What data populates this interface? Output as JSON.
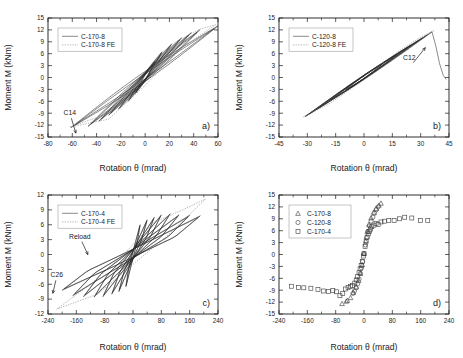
{
  "figure": {
    "panels": [
      "a)",
      "b)",
      "c)",
      "d)"
    ],
    "axis_titles": {
      "x": "Rotation θ (mrad)",
      "y": "Moment M (kNm)"
    }
  },
  "chart_data": [
    {
      "panel": "a)",
      "type": "line",
      "title": "",
      "xlabel": "Rotation θ (mrad)",
      "ylabel": "Moment M (kNm)",
      "xlim": [
        -80,
        60
      ],
      "ylim": [
        -15,
        15
      ],
      "xticks": [
        -80,
        -60,
        -40,
        -20,
        0,
        20,
        40,
        60
      ],
      "yticks": [
        -15,
        -12,
        -9,
        -6,
        -3,
        0,
        3,
        6,
        9,
        12,
        15
      ],
      "grid": false,
      "legend_position": "upper-left",
      "legend": [
        "C-170-8",
        "C-170-8 FE"
      ],
      "annotations": [
        {
          "text": "C14",
          "x": -62,
          "y": -9.5
        }
      ],
      "series": [
        {
          "name": "C-170-8",
          "style": "solid",
          "description": "Experimental cyclic moment-rotation hysteresis loops, spindle shaped, reaching about +12 kNm near +45 mrad and about -12.5 kNm near -60 mrad",
          "loops": [
            {
              "peak_pos": [
                8,
                4.0
              ],
              "peak_neg": [
                -8,
                -4.0
              ]
            },
            {
              "peak_pos": [
                14,
                6.5
              ],
              "peak_neg": [
                -14,
                -6.0
              ]
            },
            {
              "peak_pos": [
                22,
                8.5
              ],
              "peak_neg": [
                -22,
                -8.0
              ]
            },
            {
              "peak_pos": [
                30,
                10.0
              ],
              "peak_neg": [
                -30,
                -9.5
              ]
            },
            {
              "peak_pos": [
                38,
                11.3
              ],
              "peak_neg": [
                -38,
                -11.0
              ]
            },
            {
              "peak_pos": [
                45,
                12.0
              ],
              "peak_neg": [
                -47,
                -12.3
              ]
            },
            {
              "peak_pos": [
                60,
                13.0
              ],
              "peak_neg": [
                -61,
                -12.6
              ]
            }
          ]
        },
        {
          "name": "C-170-8 FE",
          "style": "dotted",
          "description": "Finite element envelope loop, wider than experimental, from (-62,-12.5) to (+58,13.3)",
          "envelope_pos": [
            [
              -62,
              -12.5
            ],
            [
              -30,
              -9.0
            ],
            [
              0,
              0.5
            ],
            [
              25,
              9.0
            ],
            [
              45,
              12.2
            ],
            [
              58,
              13.3
            ]
          ],
          "envelope_neg": [
            [
              58,
              13.3
            ],
            [
              30,
              7.5
            ],
            [
              0,
              -2.0
            ],
            [
              -30,
              -10.5
            ],
            [
              -62,
              -12.5
            ]
          ]
        }
      ]
    },
    {
      "panel": "b)",
      "type": "line",
      "title": "",
      "xlabel": "Rotation θ (mrad)",
      "ylabel": "Moment M (kNm)",
      "xlim": [
        -45,
        45
      ],
      "ylim": [
        -15,
        15
      ],
      "xticks": [
        -45,
        -30,
        -15,
        0,
        15,
        30,
        45
      ],
      "yticks": [
        -15,
        -12,
        -9,
        -6,
        -3,
        0,
        3,
        6,
        9,
        12,
        15
      ],
      "grid": false,
      "legend_position": "upper-left",
      "legend": [
        "C-120-8",
        "C-120-8 FE"
      ],
      "annotations": [
        {
          "text": "C12",
          "x": 24,
          "y": 4.5
        }
      ],
      "series": [
        {
          "name": "C-120-8",
          "style": "solid",
          "description": "Narrow elongated hysteresis loops along a steep line; peak about +11.5 kNm at +36 mrad then sharp drop (fracture) to about 0 kNm at +43 mrad; negative end about -9.8 kNm at -31 mrad",
          "loops": [
            {
              "peak_pos": [
                10,
                3.5
              ],
              "peak_neg": [
                -10,
                -3.2
              ]
            },
            {
              "peak_pos": [
                18,
                6.0
              ],
              "peak_neg": [
                -18,
                -5.8
              ]
            },
            {
              "peak_pos": [
                25,
                8.2
              ],
              "peak_neg": [
                -25,
                -8.0
              ]
            },
            {
              "peak_pos": [
                31,
                10.0
              ],
              "peak_neg": [
                -31,
                -9.8
              ]
            },
            {
              "peak_pos": [
                36,
                11.5
              ],
              "peak_neg": [
                -31,
                -9.8
              ]
            }
          ],
          "fracture": [
            [
              36,
              11.5
            ],
            [
              38,
              8.0
            ],
            [
              40,
              3.5
            ],
            [
              42,
              0.5
            ],
            [
              43.5,
              -0.5
            ]
          ]
        },
        {
          "name": "C-120-8 FE",
          "style": "dotted",
          "description": "Finite element loop slightly wider, peak near (37,11.8), negative end near (-32,-9.9)",
          "envelope_pos": [
            [
              -32,
              -9.9
            ],
            [
              -15,
              -5.0
            ],
            [
              0,
              0.3
            ],
            [
              18,
              6.5
            ],
            [
              30,
              10.2
            ],
            [
              37,
              11.8
            ]
          ],
          "envelope_neg": [
            [
              37,
              11.8
            ],
            [
              20,
              6.0
            ],
            [
              0,
              -0.6
            ],
            [
              -18,
              -6.5
            ],
            [
              -32,
              -9.9
            ]
          ]
        }
      ]
    },
    {
      "panel": "c)",
      "type": "line",
      "title": "",
      "xlabel": "Rotation θ (mrad)",
      "ylabel": "Moment M (kNm)",
      "xlim": [
        -240,
        240
      ],
      "ylim": [
        -12,
        12
      ],
      "xticks": [
        -240,
        -160,
        -80,
        0,
        80,
        160,
        240
      ],
      "yticks": [
        -12,
        -9,
        -6,
        -3,
        0,
        3,
        6,
        9,
        12
      ],
      "grid": false,
      "legend_position": "upper-left",
      "legend": [
        "C-170-4",
        "C-170-4 FE"
      ],
      "annotations": [
        {
          "text": "Reload",
          "x": -150,
          "y": 3.2
        },
        {
          "text": "C26",
          "x": -215,
          "y": -4.6
        }
      ],
      "series": [
        {
          "name": "C-170-4",
          "style": "solid",
          "description": "Many broad pinched hysteresis loops, flag shaped, positive plateau about +8 kNm, negative plateau about -8.5 kNm, rotations up to +190 and -200 mrad",
          "loops": [
            {
              "peak_pos": [
                20,
                6.0
              ],
              "peak_neg": [
                -20,
                -6.5
              ]
            },
            {
              "peak_pos": [
                40,
                7.0
              ],
              "peak_neg": [
                -40,
                -7.5
              ]
            },
            {
              "peak_pos": [
                60,
                7.5
              ],
              "peak_neg": [
                -60,
                -8.0
              ]
            },
            {
              "peak_pos": [
                80,
                8.0
              ],
              "peak_neg": [
                -85,
                -8.5
              ]
            },
            {
              "peak_pos": [
                105,
                8.2
              ],
              "peak_neg": [
                -110,
                -8.6
              ]
            },
            {
              "peak_pos": [
                130,
                8.0
              ],
              "peak_neg": [
                -140,
                -8.5
              ]
            },
            {
              "peak_pos": [
                160,
                7.9
              ],
              "peak_neg": [
                -170,
                -8.3
              ]
            },
            {
              "peak_pos": [
                190,
                7.8
              ],
              "peak_neg": [
                -200,
                -7.2
              ]
            }
          ]
        },
        {
          "name": "C-170-4 FE",
          "style": "dotted",
          "description": "Finite element envelope reaching about +11 kNm near +200 mrad and -11 kNm near -215 mrad",
          "envelope_pos": [
            [
              -215,
              -11.0
            ],
            [
              -120,
              -6.0
            ],
            [
              -20,
              0.5
            ],
            [
              60,
              6.5
            ],
            [
              140,
              9.0
            ],
            [
              205,
              11.2
            ]
          ],
          "envelope_neg": [
            [
              205,
              11.2
            ],
            [
              100,
              4.0
            ],
            [
              0,
              -2.0
            ],
            [
              -100,
              -8.0
            ],
            [
              -215,
              -11.0
            ]
          ]
        }
      ]
    },
    {
      "panel": "d)",
      "type": "scatter",
      "title": "",
      "xlabel": "Rotation θ (mrad)",
      "ylabel": "Moment M (kNm)",
      "xlim": [
        -240,
        240
      ],
      "ylim": [
        -15,
        15
      ],
      "xticks": [
        -240,
        -160,
        -80,
        0,
        80,
        160,
        240
      ],
      "yticks": [
        -15,
        -12,
        -9,
        -6,
        -3,
        0,
        3,
        6,
        9,
        12,
        15
      ],
      "grid": false,
      "legend_position": "upper-left",
      "legend": [
        "C-170-8",
        "C-120-8",
        "C-170-4"
      ],
      "series": [
        {
          "name": "C-170-8",
          "marker": "triangle",
          "points": [
            [
              -62,
              -12.4
            ],
            [
              -50,
              -11.8
            ],
            [
              -47,
              -11.6
            ],
            [
              -38,
              -10.9
            ],
            [
              -30,
              -9.6
            ],
            [
              -22,
              -8.2
            ],
            [
              -15,
              -6.6
            ],
            [
              -10,
              -4.8
            ],
            [
              -5,
              -2.6
            ],
            [
              0,
              0.2
            ],
            [
              5,
              3.4
            ],
            [
              9,
              5.8
            ],
            [
              14,
              7.6
            ],
            [
              20,
              9.2
            ],
            [
              27,
              10.6
            ],
            [
              34,
              11.6
            ],
            [
              42,
              12.4
            ],
            [
              48,
              12.9
            ]
          ]
        },
        {
          "name": "C-120-8",
          "marker": "circle",
          "points": [
            [
              -31,
              -9.8
            ],
            [
              -27,
              -9.2
            ],
            [
              -22,
              -8.4
            ],
            [
              -18,
              -7.4
            ],
            [
              -14,
              -6.2
            ],
            [
              -10,
              -4.8
            ],
            [
              -7,
              -3.4
            ],
            [
              -4,
              -1.8
            ],
            [
              0,
              0.2
            ],
            [
              4,
              2.4
            ],
            [
              7,
              4.2
            ],
            [
              11,
              5.8
            ],
            [
              15,
              7.2
            ],
            [
              20,
              8.4
            ],
            [
              25,
              9.4
            ],
            [
              30,
              10.4
            ],
            [
              35,
              11.3
            ],
            [
              40,
              12.0
            ]
          ]
        },
        {
          "name": "C-170-4",
          "marker": "square",
          "points": [
            [
              -205,
              -8.0
            ],
            [
              -185,
              -8.3
            ],
            [
              -170,
              -8.4
            ],
            [
              -150,
              -8.5
            ],
            [
              -130,
              -8.8
            ],
            [
              -115,
              -9.2
            ],
            [
              -100,
              -9.3
            ],
            [
              -88,
              -9.1
            ],
            [
              -78,
              -9.4
            ],
            [
              -68,
              -10.4
            ],
            [
              -60,
              -9.8
            ],
            [
              -52,
              -8.7
            ],
            [
              -45,
              -8.3
            ],
            [
              -38,
              -8.1
            ],
            [
              -32,
              -7.8
            ],
            [
              -26,
              -7.2
            ],
            [
              -22,
              -6.4
            ],
            [
              -18,
              -5.6
            ],
            [
              -14,
              -4.6
            ],
            [
              -11,
              -3.6
            ],
            [
              -8,
              -2.8
            ],
            [
              -5,
              -1.8
            ],
            [
              -2,
              -0.4
            ],
            [
              0,
              0.2
            ],
            [
              3,
              2.0
            ],
            [
              6,
              3.4
            ],
            [
              9,
              4.4
            ],
            [
              12,
              5.2
            ],
            [
              15,
              5.8
            ],
            [
              18,
              6.4
            ],
            [
              22,
              7.0
            ],
            [
              28,
              7.4
            ],
            [
              34,
              7.8
            ],
            [
              40,
              7.6
            ],
            [
              48,
              8.2
            ],
            [
              58,
              8.4
            ],
            [
              70,
              8.6
            ],
            [
              85,
              8.6
            ],
            [
              100,
              9.0
            ],
            [
              115,
              9.4
            ],
            [
              135,
              9.2
            ],
            [
              160,
              8.6
            ],
            [
              180,
              8.6
            ]
          ]
        }
      ]
    }
  ]
}
